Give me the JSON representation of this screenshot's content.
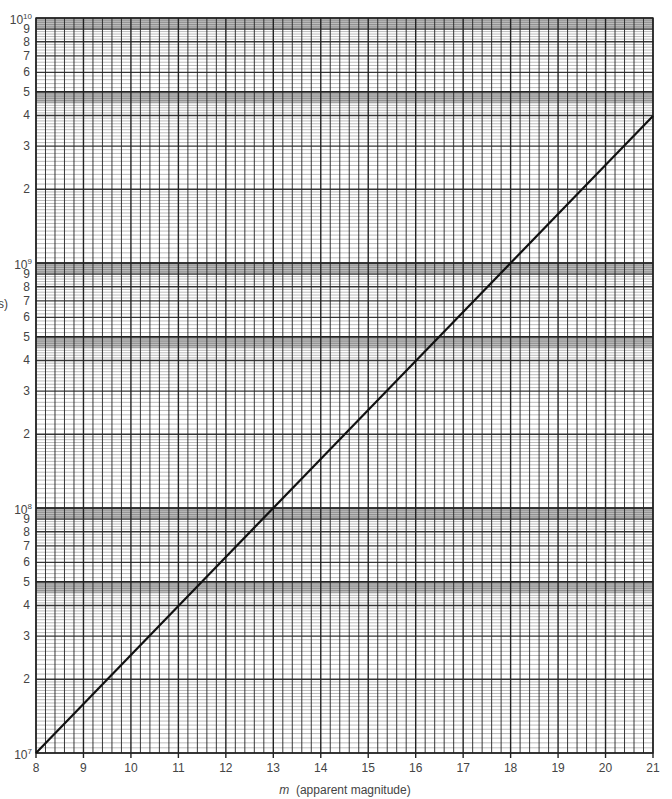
{
  "chart_data": {
    "type": "line",
    "title": "",
    "xlabel_var": "m",
    "xlabel_text": "(apparent magnitude)",
    "ylabel_fragment": "s)",
    "x_scale": "linear",
    "y_scale": "log",
    "xlim": [
      8,
      21
    ],
    "ylim": [
      10000000,
      10000000000
    ],
    "x_ticks": [
      "8",
      "9",
      "10",
      "11",
      "12",
      "13",
      "14",
      "15",
      "16",
      "17",
      "18",
      "19",
      "20",
      "21"
    ],
    "y_decade_labels": [
      {
        "base": "10",
        "exp": "7",
        "value": 10000000
      },
      {
        "base": "10",
        "exp": "8",
        "value": 100000000
      },
      {
        "base": "10",
        "exp": "9",
        "value": 1000000000
      },
      {
        "base": "10",
        "exp": "10",
        "value": 10000000000
      }
    ],
    "y_minor_labels": [
      "2",
      "3",
      "4",
      "5",
      "6",
      "7",
      "8",
      "9"
    ],
    "grid": true,
    "grid_style": "semi-log graph paper, 5 minor x divisions per magnitude, shaded bands near 5 and 9-10 in each decade",
    "series": [
      {
        "name": "distance vs apparent magnitude",
        "x": [
          8,
          9,
          10,
          11,
          12,
          13,
          14,
          15,
          16,
          17,
          18,
          19,
          20,
          21
        ],
        "y": [
          10000000,
          15850000,
          25120000,
          39810000,
          63100000,
          100000000,
          158500000,
          251200000,
          398100000,
          631000000,
          1000000000,
          1585000000,
          2512000000,
          3981000000
        ],
        "color": "#111111"
      }
    ],
    "legend": null
  },
  "layout": {
    "plot_left": 36,
    "plot_right": 653,
    "plot_top": 18,
    "plot_bottom": 753,
    "grid_color": "#222222",
    "shade_color": "#bdbdbd",
    "line_color": "#111111"
  }
}
